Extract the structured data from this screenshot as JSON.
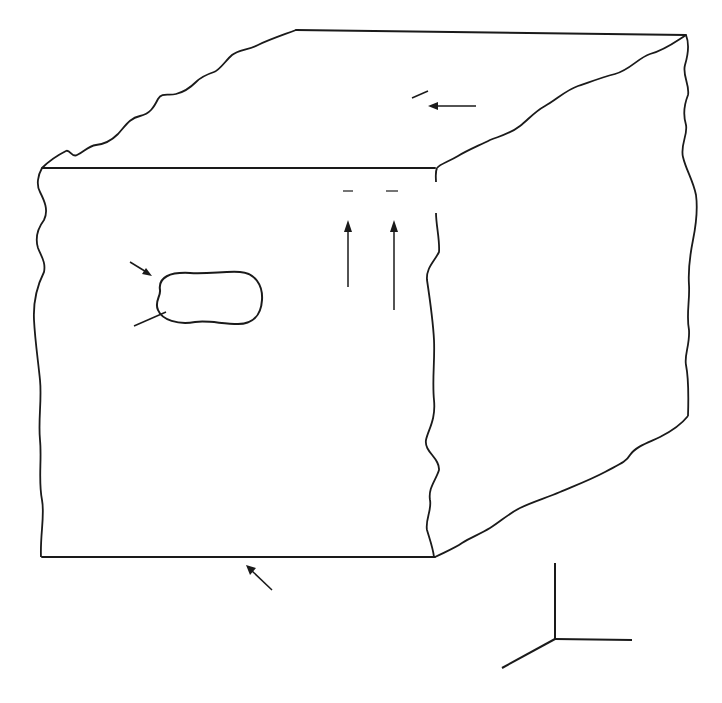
{
  "figure": {
    "colors": {
      "ink": "#1a1a1a",
      "background": "#ffffff"
    }
  },
  "labels": {
    "rho_sb_plus": {
      "symbol": "ρ",
      "subscript": "sb(+)"
    },
    "rho_sb_minus": {
      "symbol": "ρ",
      "subscript": "sb(−)"
    },
    "delta_v": "Δ𝓋",
    "rho_vb": {
      "symbol": "ρ",
      "subscript": "vb",
      "equals": "= 0"
    },
    "polarization": "P",
    "applied_field": {
      "symbol": "E",
      "subscript": "a",
      "note": "(Uniform)"
    }
  },
  "axes": {
    "x": "x",
    "y": "y",
    "z": "z"
  },
  "top_surface_charges": {
    "sign": "+",
    "rows": [
      {
        "count": 5,
        "y": 43,
        "x": [
          401,
          434,
          467,
          500,
          533
        ]
      },
      {
        "count": 5,
        "y": 73,
        "x": [
          351,
          380,
          414,
          448,
          483
        ]
      },
      {
        "count": 5,
        "y": 106,
        "x": [
          293,
          325,
          355,
          385,
          418
        ]
      },
      {
        "count": 5,
        "y": 137,
        "x": [
          236,
          268,
          297,
          331,
          362
        ]
      }
    ]
  },
  "dipole_chains": {
    "columns_x": [
      177,
      209,
      240,
      272,
      304
    ],
    "charges": [
      {
        "sign": "+",
        "y": 178
      },
      {
        "sign": "-",
        "y": 224
      },
      {
        "sign": "+",
        "y": 243
      },
      {
        "sign": "-",
        "y": 289
      },
      {
        "sign": "+",
        "y": 308
      },
      {
        "sign": "-",
        "y": 354
      },
      {
        "sign": "+",
        "y": 375
      },
      {
        "sign": "-",
        "y": 420
      },
      {
        "sign": "+",
        "y": 438
      },
      {
        "sign": "-",
        "y": 485
      },
      {
        "sign": "+",
        "y": 503
      },
      {
        "sign": "-",
        "y": 552
      }
    ]
  }
}
